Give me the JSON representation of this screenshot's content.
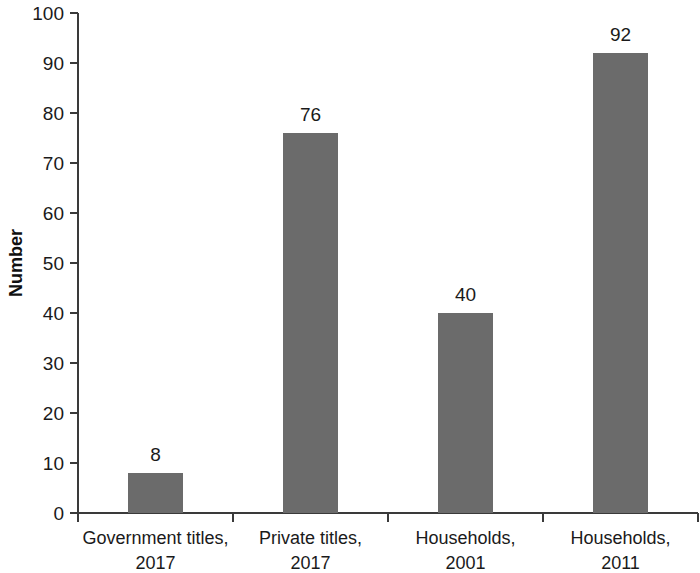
{
  "chart_data": {
    "type": "bar",
    "title": "",
    "xlabel": "",
    "ylabel": "Number",
    "ylim": [
      0,
      100
    ],
    "ytick_step": 10,
    "yticks": [
      "0",
      "10",
      "20",
      "30",
      "40",
      "50",
      "60",
      "70",
      "80",
      "90",
      "100"
    ],
    "grid": false,
    "legend": false,
    "bar_color": "#6b6b6b",
    "axis_color": "#3a3a3a",
    "categories": [
      "Government titles, 2017",
      "Private titles, 2017",
      "Households, 2001",
      "Households, 2011"
    ],
    "category_lines": [
      [
        "Government titles,",
        "2017"
      ],
      [
        "Private titles,",
        "2017"
      ],
      [
        "Households,",
        "2001"
      ],
      [
        "Households,",
        "2011"
      ]
    ],
    "values": [
      8,
      76,
      40,
      92
    ],
    "value_labels": [
      "8",
      "76",
      "40",
      "92"
    ]
  }
}
